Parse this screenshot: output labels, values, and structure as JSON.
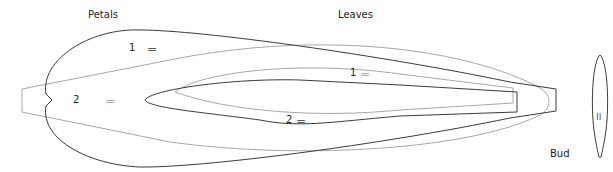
{
  "labels": {
    "petals": "Petals",
    "leaves": "Leaves",
    "bud": "Bud"
  },
  "markers": {
    "petal_1": "1",
    "petal_2": "2",
    "leaf_1": "1",
    "leaf_2": "2",
    "equals": "=",
    "bud_mark": "II"
  },
  "colors": {
    "dark_stroke": "#3a3a3a",
    "light_stroke": "#a8a8a8",
    "background": "#ffffff"
  }
}
